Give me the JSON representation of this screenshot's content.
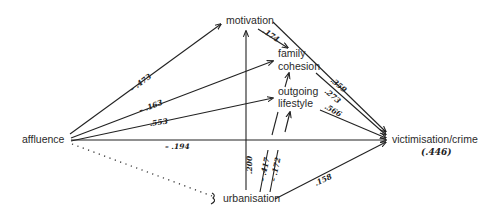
{
  "diagram": {
    "type": "path-diagram",
    "nodes": {
      "affluence": "affluence",
      "motivation": "motivation",
      "family_cohesion_line1": "family",
      "family_cohesion_line2": "cohesion",
      "outgoing_lifestyle_line1": "outgoing",
      "outgoing_lifestyle_line2": "lifestyle",
      "victimisation": "victimisation/crime",
      "victimisation_r2": "(.446)",
      "urbanisation": "urbanisation"
    },
    "edges": [
      {
        "from": "affluence",
        "to": "motivation",
        "coef": "– .473"
      },
      {
        "from": "affluence",
        "to": "family cohesion",
        "coef": "– .163"
      },
      {
        "from": "affluence",
        "to": "outgoing lifestyle",
        "coef": ".553"
      },
      {
        "from": "affluence",
        "to": "victimisation/crime",
        "coef": "– .194"
      },
      {
        "from": "affluence",
        "to": "urbanisation",
        "coef": "",
        "style": "dotted"
      },
      {
        "from": "motivation",
        "to": "family cohesion",
        "coef": ".174"
      },
      {
        "from": "motivation",
        "to": "victimisation/crime",
        "coef": ".359"
      },
      {
        "from": "family cohesion",
        "to": "victimisation/crime",
        "coef": ".273"
      },
      {
        "from": "outgoing lifestyle",
        "to": "family cohesion",
        "coef": ""
      },
      {
        "from": "outgoing lifestyle",
        "to": "victimisation/crime",
        "coef": ".566"
      },
      {
        "from": "urbanisation",
        "to": "motivation",
        "coef": ".200"
      },
      {
        "from": "urbanisation",
        "to": "family cohesion",
        "coef": "– .417"
      },
      {
        "from": "urbanisation",
        "to": "outgoing lifestyle",
        "coef": "– .172"
      },
      {
        "from": "urbanisation",
        "to": "victimisation/crime",
        "coef": ".158"
      }
    ]
  }
}
